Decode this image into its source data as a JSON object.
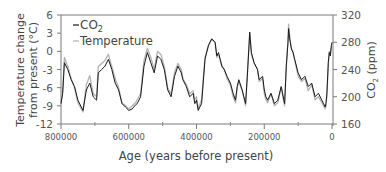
{
  "chart_data": {
    "type": "line",
    "title": "",
    "xlabel": "Age (years before present)",
    "ylabel_left": "Temperature change from present (°C)",
    "ylabel_left_lines": [
      "Temperature change",
      "from present (°C)"
    ],
    "ylabel_right": "CO2 (ppm)",
    "xlim": [
      800000,
      0
    ],
    "ylim_left": [
      -12,
      6
    ],
    "ylim_right": [
      160,
      320
    ],
    "x_ticks": [
      800000,
      600000,
      400000,
      200000,
      0
    ],
    "x_tick_labels": [
      "800000",
      "600000",
      "400000",
      "200000",
      "0"
    ],
    "y_left_ticks": [
      6,
      3,
      0,
      -3,
      -6,
      -9,
      -12
    ],
    "y_left_tick_labels": [
      "6",
      "3",
      "0",
      "-3",
      "-6",
      "-9",
      "-12"
    ],
    "y_right_ticks": [
      320,
      280,
      240,
      200,
      160
    ],
    "y_right_tick_labels": [
      "320",
      "280",
      "240",
      "200",
      "160"
    ],
    "grid": false,
    "legend": {
      "position": "upper-left",
      "entries": [
        {
          "label": "CO2",
          "sub": "2",
          "base": "CO",
          "color": "#1a1a1a"
        },
        {
          "label": "Temperature",
          "color": "#b3b3b3"
        }
      ]
    },
    "series": [
      {
        "name": "CO2",
        "axis": "right",
        "unit": "ppm",
        "color": "#1a1a1a",
        "x": [
          800000,
          795000,
          790000,
          780000,
          770000,
          760000,
          750000,
          740000,
          735000,
          725000,
          715000,
          705000,
          695000,
          690000,
          680000,
          670000,
          660000,
          650000,
          640000,
          630000,
          620000,
          610000,
          600000,
          590000,
          580000,
          575000,
          565000,
          555000,
          545000,
          535000,
          525000,
          515000,
          505000,
          495000,
          485000,
          475000,
          465000,
          455000,
          445000,
          440000,
          430000,
          420000,
          410000,
          405000,
          400000,
          395000,
          385000,
          375000,
          365000,
          355000,
          345000,
          340000,
          335000,
          330000,
          325000,
          318000,
          310000,
          300000,
          292000,
          285000,
          280000,
          275000,
          265000,
          255000,
          250000,
          245000,
          243000,
          238000,
          230000,
          220000,
          215000,
          205000,
          200000,
          195000,
          190000,
          180000,
          170000,
          160000,
          150000,
          140000,
          135000,
          130000,
          128000,
          125000,
          120000,
          115000,
          110000,
          100000,
          90000,
          80000,
          70000,
          60000,
          50000,
          40000,
          30000,
          20000,
          18000,
          15000,
          11000,
          8000,
          5000,
          2000,
          0
        ],
        "values": [
          190,
          205,
          250,
          240,
          225,
          215,
          195,
          185,
          180,
          210,
          220,
          200,
          195,
          235,
          240,
          245,
          255,
          240,
          220,
          210,
          190,
          185,
          180,
          182,
          188,
          190,
          200,
          245,
          265,
          250,
          235,
          260,
          255,
          240,
          210,
          200,
          230,
          245,
          235,
          225,
          215,
          200,
          205,
          190,
          195,
          180,
          190,
          255,
          275,
          285,
          280,
          260,
          265,
          255,
          245,
          240,
          230,
          220,
          205,
          195,
          215,
          225,
          210,
          190,
          230,
          275,
          295,
          265,
          250,
          240,
          225,
          230,
          210,
          200,
          195,
          205,
          190,
          195,
          215,
          190,
          245,
          280,
          300,
          285,
          270,
          265,
          255,
          235,
          225,
          230,
          215,
          220,
          200,
          205,
          195,
          185,
          190,
          205,
          250,
          265,
          260,
          275,
          280
        ]
      },
      {
        "name": "Temperature",
        "axis": "left",
        "unit": "°C",
        "color": "#b3b3b3",
        "x": [
          800000,
          795000,
          790000,
          780000,
          770000,
          760000,
          750000,
          740000,
          735000,
          725000,
          715000,
          705000,
          695000,
          690000,
          680000,
          670000,
          660000,
          650000,
          640000,
          630000,
          620000,
          610000,
          600000,
          590000,
          580000,
          575000,
          565000,
          555000,
          545000,
          535000,
          525000,
          515000,
          505000,
          495000,
          485000,
          475000,
          465000,
          455000,
          445000,
          440000,
          430000,
          420000,
          410000,
          405000,
          400000,
          395000,
          385000,
          375000,
          365000,
          355000,
          345000,
          340000,
          335000,
          330000,
          325000,
          318000,
          310000,
          300000,
          292000,
          285000,
          280000,
          275000,
          265000,
          255000,
          250000,
          245000,
          243000,
          238000,
          230000,
          220000,
          215000,
          205000,
          200000,
          195000,
          190000,
          180000,
          170000,
          160000,
          150000,
          140000,
          135000,
          130000,
          128000,
          125000,
          120000,
          115000,
          110000,
          100000,
          90000,
          80000,
          70000,
          60000,
          50000,
          40000,
          30000,
          20000,
          18000,
          15000,
          11000,
          8000,
          5000,
          2000,
          0
        ],
        "values": [
          -8.5,
          -6.5,
          -1.0,
          -2.5,
          -4.5,
          -6.0,
          -8.5,
          -9.5,
          -10.0,
          -5.5,
          -4.0,
          -7.0,
          -7.5,
          -2.5,
          -2.0,
          -1.5,
          -0.5,
          -2.5,
          -4.5,
          -6.0,
          -8.5,
          -9.0,
          -9.5,
          -9.0,
          -8.5,
          -8.0,
          -7.0,
          -1.5,
          0.5,
          -1.0,
          -3.0,
          0.0,
          -0.5,
          -2.5,
          -6.0,
          -7.0,
          -3.5,
          -2.0,
          -3.0,
          -4.5,
          -5.5,
          -7.0,
          -6.5,
          -8.0,
          -7.5,
          -9.5,
          -8.0,
          -1.0,
          1.0,
          2.0,
          1.5,
          -1.0,
          -0.5,
          -1.5,
          -2.5,
          -3.0,
          -4.5,
          -5.5,
          -7.5,
          -8.5,
          -6.0,
          -5.0,
          -6.5,
          -9.0,
          -4.0,
          1.0,
          3.0,
          -0.5,
          -2.0,
          -3.0,
          -5.0,
          -4.5,
          -7.0,
          -8.0,
          -8.5,
          -7.0,
          -9.0,
          -8.5,
          -6.0,
          -9.0,
          -2.5,
          2.0,
          4.5,
          2.5,
          0.5,
          0.0,
          -1.5,
          -4.0,
          -5.0,
          -4.5,
          -6.5,
          -5.5,
          -8.0,
          -7.5,
          -8.5,
          -9.5,
          -9.0,
          -7.5,
          -2.0,
          0.0,
          -0.5,
          0.5,
          1.0
        ]
      }
    ]
  }
}
